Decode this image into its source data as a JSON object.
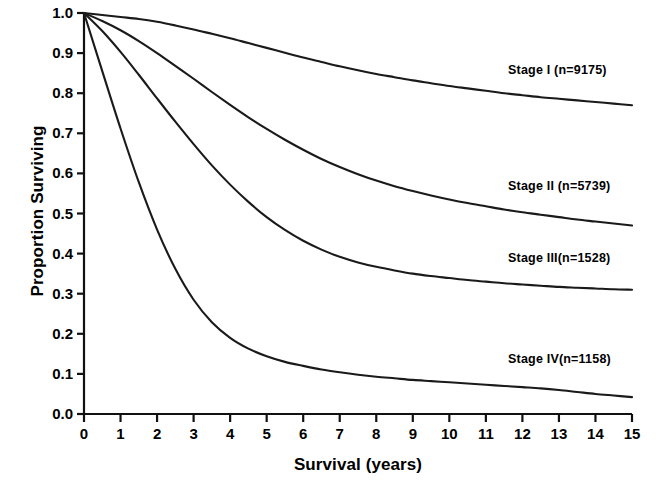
{
  "chart_data": {
    "type": "line",
    "title": "",
    "subtitle": "",
    "xlabel": "Survival (years)",
    "ylabel": "Proportion Surviving",
    "xlim": [
      0,
      15
    ],
    "ylim": [
      0.0,
      1.0
    ],
    "grid": false,
    "legend_position": "inline-right",
    "x_tick_labels": [
      "0",
      "1",
      "2",
      "3",
      "4",
      "5",
      "6",
      "7",
      "8",
      "9",
      "10",
      "11",
      "12",
      "13",
      "14",
      "15"
    ],
    "y_tick_labels": [
      "0.0",
      "0.1",
      "0.2",
      "0.3",
      "0.4",
      "0.5",
      "0.6",
      "0.7",
      "0.8",
      "0.9",
      "1.0"
    ],
    "x": [
      0,
      0.5,
      1,
      1.5,
      2,
      2.5,
      3,
      3.5,
      4,
      4.5,
      5,
      5.5,
      6,
      6.5,
      7,
      7.5,
      8,
      8.5,
      9,
      9.5,
      10,
      10.5,
      11,
      11.5,
      12,
      12.5,
      13,
      13.5,
      14,
      14.5,
      15
    ],
    "series": [
      {
        "name": "Stage I",
        "n": 9175,
        "label": "Stage I  (n=9175)",
        "color": "#1a1a1a",
        "values": [
          1.0,
          0.995,
          0.99,
          0.985,
          0.978,
          0.969,
          0.959,
          0.948,
          0.937,
          0.925,
          0.913,
          0.901,
          0.889,
          0.878,
          0.867,
          0.857,
          0.848,
          0.84,
          0.832,
          0.825,
          0.818,
          0.812,
          0.806,
          0.8,
          0.795,
          0.79,
          0.786,
          0.782,
          0.778,
          0.774,
          0.77
        ]
      },
      {
        "name": "Stage II",
        "n": 5739,
        "label": "Stage II (n=5739)",
        "color": "#1a1a1a",
        "values": [
          1.0,
          0.98,
          0.957,
          0.93,
          0.9,
          0.868,
          0.836,
          0.803,
          0.771,
          0.74,
          0.711,
          0.684,
          0.659,
          0.636,
          0.616,
          0.598,
          0.582,
          0.568,
          0.556,
          0.545,
          0.535,
          0.526,
          0.518,
          0.51,
          0.503,
          0.497,
          0.491,
          0.485,
          0.48,
          0.475,
          0.47
        ]
      },
      {
        "name": "Stage III",
        "n": 1528,
        "label": "Stage III(n=1528)",
        "color": "#1a1a1a",
        "values": [
          1.0,
          0.955,
          0.903,
          0.846,
          0.787,
          0.729,
          0.673,
          0.62,
          0.572,
          0.529,
          0.491,
          0.459,
          0.432,
          0.41,
          0.392,
          0.378,
          0.367,
          0.358,
          0.35,
          0.344,
          0.339,
          0.334,
          0.33,
          0.326,
          0.323,
          0.32,
          0.317,
          0.315,
          0.313,
          0.311,
          0.31
        ]
      },
      {
        "name": "Stage IV",
        "n": 1158,
        "label": "Stage IV(n=1158)",
        "color": "#1a1a1a",
        "values": [
          1.0,
          0.855,
          0.712,
          0.578,
          0.46,
          0.362,
          0.285,
          0.229,
          0.19,
          0.163,
          0.144,
          0.13,
          0.12,
          0.111,
          0.104,
          0.098,
          0.093,
          0.089,
          0.085,
          0.082,
          0.079,
          0.076,
          0.073,
          0.07,
          0.067,
          0.064,
          0.06,
          0.055,
          0.05,
          0.046,
          0.042
        ]
      }
    ]
  },
  "labels": {
    "y_axis_title": "Proportion Surviving",
    "x_axis_title": "Survival (years)"
  }
}
